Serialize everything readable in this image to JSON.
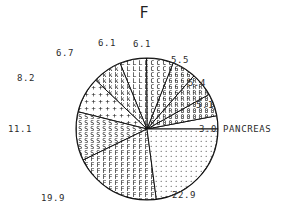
{
  "chart_data": {
    "type": "pie",
    "title": "F",
    "subtitle": "",
    "xlabel": "",
    "ylabel": "",
    "legend_position": "none",
    "grid": false,
    "units": "percent",
    "total": 100.0,
    "start_angle_deg": 0,
    "direction": "counterclockwise",
    "categories": [
      "3.0 PANCREAS",
      "5.1",
      "5.4",
      "5.5",
      "6.1",
      "6.1",
      "6.7",
      "8.2",
      "11.1",
      "19.9",
      "22.9"
    ],
    "values": [
      3.0,
      5.1,
      5.4,
      5.5,
      6.1,
      6.1,
      6.7,
      8.2,
      11.1,
      19.9,
      22.9
    ],
    "slices": [
      {
        "id": "slice-pancreas",
        "label": "3.0 PANCREAS",
        "value": 3.0,
        "fill": "blank",
        "label_x": 196,
        "label_y": 126
      },
      {
        "id": "slice-5-1",
        "label": "5.1",
        "value": 5.1,
        "fill": "zero-chars",
        "label_x": 197,
        "label_y": 105
      },
      {
        "id": "slice-5-4",
        "label": "5.4",
        "value": 5.4,
        "fill": "r-chars",
        "label_x": 193,
        "label_y": 84
      },
      {
        "id": "slice-5-5",
        "label": "5.5",
        "value": 5.5,
        "fill": "six-chars",
        "label_x": 180,
        "label_y": 61
      },
      {
        "id": "slice-6-1-a",
        "label": "6.1",
        "value": 6.1,
        "fill": "c-chars",
        "label_x": 133,
        "label_y": 45
      },
      {
        "id": "slice-6-1-b",
        "label": "6.1",
        "value": 6.1,
        "fill": "l-chars",
        "label_x": 98,
        "label_y": 43
      },
      {
        "id": "slice-6-7",
        "label": "6.7",
        "value": 6.7,
        "fill": "k-chars",
        "label_x": 56,
        "label_y": 55
      },
      {
        "id": "slice-8-2",
        "label": "8.2",
        "value": 8.2,
        "fill": "plus-chars",
        "label_x": 18,
        "label_y": 78
      },
      {
        "id": "slice-11-1",
        "label": "11.1",
        "value": 11.1,
        "fill": "s-chars",
        "label_x": 10,
        "label_y": 125
      },
      {
        "id": "slice-19-9",
        "label": "19.9",
        "value": 19.9,
        "fill": "f-chars",
        "label_x": 44,
        "label_y": 199
      },
      {
        "id": "slice-22-9",
        "label": "22.9",
        "value": 22.9,
        "fill": "dots",
        "label_x": 176,
        "label_y": 196
      }
    ]
  }
}
